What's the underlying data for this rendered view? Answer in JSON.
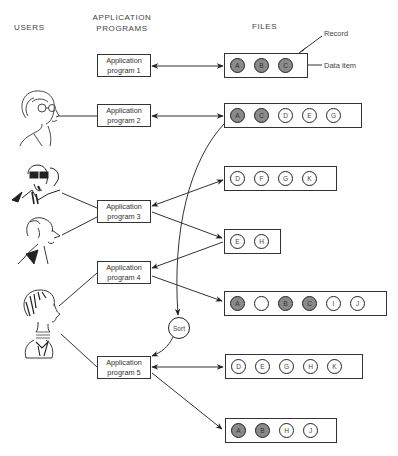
{
  "headers": {
    "users": "USERS",
    "programs_line1": "APPLICATION",
    "programs_line2": "PROGRAMS",
    "files": "FILES"
  },
  "annotations": {
    "record": "Record",
    "data_item": "Data item"
  },
  "programs": [
    {
      "line1": "Application",
      "line2": "program 1"
    },
    {
      "line1": "Application",
      "line2": "program 2"
    },
    {
      "line1": "Application",
      "line2": "program 3"
    },
    {
      "line1": "Application",
      "line2": "program 4"
    },
    {
      "line1": "Application",
      "line2": "program 5"
    }
  ],
  "files": [
    {
      "items": [
        {
          "label": "A",
          "shaded": true
        },
        {
          "label": "B",
          "shaded": true
        },
        {
          "label": "C",
          "shaded": true
        }
      ]
    },
    {
      "items": [
        {
          "label": "A",
          "shaded": true
        },
        {
          "label": "C",
          "shaded": true
        },
        {
          "label": "D",
          "shaded": false
        },
        {
          "label": "E",
          "shaded": false
        },
        {
          "label": "G",
          "shaded": false
        }
      ]
    },
    {
      "items": [
        {
          "label": "D",
          "shaded": false
        },
        {
          "label": "F",
          "shaded": false
        },
        {
          "label": "G",
          "shaded": false
        },
        {
          "label": "K",
          "shaded": false
        }
      ]
    },
    {
      "items": [
        {
          "label": "E",
          "shaded": false
        },
        {
          "label": "H",
          "shaded": false
        }
      ]
    },
    {
      "items": [
        {
          "label": "A",
          "shaded": true
        },
        {
          "label": "",
          "shaded": false
        },
        {
          "label": "B",
          "shaded": true
        },
        {
          "label": "C",
          "shaded": true
        },
        {
          "label": "I",
          "shaded": false
        },
        {
          "label": "J",
          "shaded": false
        }
      ]
    },
    {
      "items": [
        {
          "label": "D",
          "shaded": false
        },
        {
          "label": "E",
          "shaded": false
        },
        {
          "label": "G",
          "shaded": false
        },
        {
          "label": "H",
          "shaded": false
        },
        {
          "label": "K",
          "shaded": false
        }
      ]
    },
    {
      "items": [
        {
          "label": "A",
          "shaded": true
        },
        {
          "label": "B",
          "shaded": true
        },
        {
          "label": "H",
          "shaded": false
        },
        {
          "label": "J",
          "shaded": false
        }
      ]
    }
  ],
  "sort": {
    "label": "Sort"
  },
  "users": [
    "user-woman-glasses",
    "user-man-phone",
    "user-man-profile",
    "user-woman-short-hair"
  ],
  "colors": {
    "shaded": "#8a8a8a",
    "line": "#333333"
  }
}
